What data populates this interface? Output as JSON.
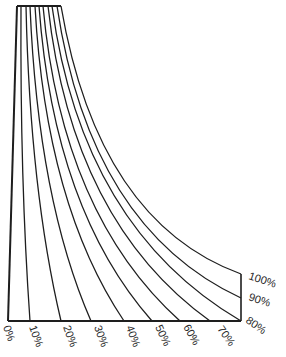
{
  "diagram": {
    "stroke_color": "#1e1e1e",
    "background": "#ffffff",
    "bottom_labels": [
      "0%",
      "10%",
      "20%",
      "30%",
      "40%",
      "50%",
      "60%",
      "70%",
      "80%"
    ],
    "right_labels": [
      "80%",
      "90%",
      "100%"
    ],
    "curves": [
      {
        "label": "0%",
        "top_x": 17,
        "end": [
          8,
          321
        ],
        "ctrl": [
          12,
          160
        ]
      },
      {
        "label": "10%",
        "top_x": 21,
        "end": [
          30,
          321
        ],
        "ctrl": [
          20,
          180
        ]
      },
      {
        "label": "20%",
        "top_x": 26,
        "end": [
          61,
          321
        ],
        "ctrl": [
          30,
          190
        ]
      },
      {
        "label": "30%",
        "top_x": 30,
        "end": [
          91,
          321
        ],
        "ctrl": [
          38,
          200
        ]
      },
      {
        "label": "40%",
        "top_x": 35,
        "end": [
          124,
          321
        ],
        "ctrl": [
          46,
          205
        ]
      },
      {
        "label": "50%",
        "top_x": 39,
        "end": [
          152,
          321
        ],
        "ctrl": [
          54,
          210
        ]
      },
      {
        "label": "60%",
        "top_x": 43,
        "end": [
          180,
          321
        ],
        "ctrl": [
          62,
          215
        ]
      },
      {
        "label": "70%",
        "top_x": 48,
        "end": [
          210,
          321
        ],
        "ctrl": [
          72,
          222
        ]
      },
      {
        "label": "80%",
        "top_x": 52,
        "end": [
          241,
          321
        ],
        "ctrl": [
          82,
          228
        ]
      },
      {
        "label": "90%",
        "top_x": 57,
        "end": [
          241,
          298
        ],
        "ctrl": [
          90,
          228
        ]
      },
      {
        "label": "100%",
        "top_x": 61,
        "end": [
          241,
          274
        ],
        "ctrl": [
          98,
          222
        ]
      }
    ]
  }
}
